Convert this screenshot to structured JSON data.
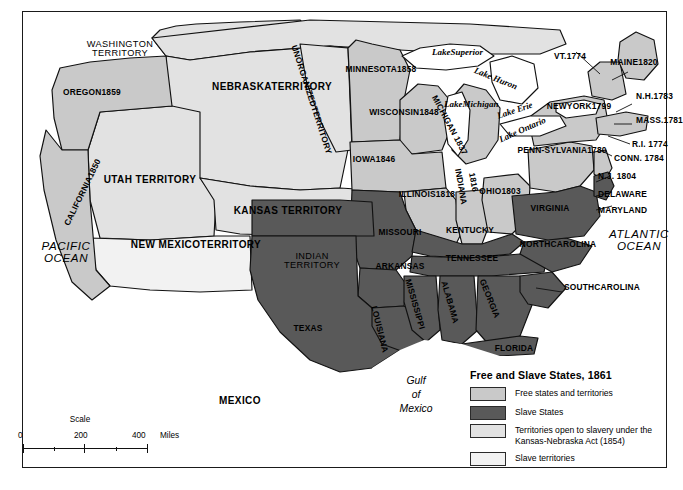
{
  "map": {
    "title": "Free and Slave States, 1861",
    "colors": {
      "free": "#c9c9c9",
      "slave": "#595959",
      "kansas_nebraska": "#e2e2e2",
      "slave_territory": "#f2f2f2",
      "water": "#ffffff",
      "outline": "#111111"
    },
    "oceans": [
      {
        "name": "pacific-ocean",
        "lines": [
          "PACIFIC",
          "OCEAN"
        ]
      },
      {
        "name": "atlantic-ocean",
        "lines": [
          "ATLANTIC",
          "OCEAN"
        ]
      }
    ],
    "gulf": {
      "lines": [
        "Gulf",
        "of",
        "Mexico"
      ]
    },
    "mexico": "MEXICO",
    "lakes": [
      {
        "label": "Lake",
        "label2": "Superior"
      },
      {
        "label": "Lake Huron"
      },
      {
        "label": "Lake",
        "label2": "Michigan"
      },
      {
        "label": "Lake Erie"
      },
      {
        "label": "Lake Ontario"
      }
    ],
    "regions": [
      {
        "name": "washington-territory",
        "lines": [
          "WASHINGTON",
          "TERRITORY"
        ],
        "fill": "kansas_nebraska"
      },
      {
        "name": "oregon",
        "lines": [
          "OREGON",
          "1859"
        ],
        "fill": "free"
      },
      {
        "name": "california",
        "lines": [
          "CALIFORNIA",
          "1850"
        ],
        "fill": "free"
      },
      {
        "name": "utah-territory",
        "lines": [
          "UTAH TERRITORY"
        ],
        "fill": "kansas_nebraska"
      },
      {
        "name": "new-mexico-territory",
        "lines": [
          "NEW MEXICO",
          "TERRITORY"
        ],
        "fill": "slave_territory"
      },
      {
        "name": "nebraska-territory",
        "lines": [
          "NEBRASKA",
          "TERRITORY"
        ],
        "fill": "kansas_nebraska"
      },
      {
        "name": "unorganized-territory",
        "lines": [
          "UNORGANIZED",
          "TERRITORY"
        ],
        "fill": "kansas_nebraska"
      },
      {
        "name": "kansas-territory",
        "lines": [
          "KANSAS TERRITORY"
        ],
        "fill": "kansas_nebraska"
      },
      {
        "name": "indian-territory",
        "lines": [
          "INDIAN",
          "TERRITORY"
        ],
        "fill": "slave"
      },
      {
        "name": "minnesota",
        "lines": [
          "MINNESOTA",
          "1858"
        ],
        "fill": "free"
      },
      {
        "name": "wisconsin",
        "lines": [
          "WISCONSIN",
          "1848"
        ],
        "fill": "free"
      },
      {
        "name": "iowa",
        "lines": [
          "IOWA",
          "1846"
        ],
        "fill": "free"
      },
      {
        "name": "illinois",
        "lines": [
          "ILLINOIS",
          "1818"
        ],
        "fill": "free"
      },
      {
        "name": "indiana",
        "lines": [
          "INDIANA",
          "1816"
        ],
        "fill": "free"
      },
      {
        "name": "michigan",
        "lines": [
          "MICHIGAN 1837"
        ],
        "fill": "free"
      },
      {
        "name": "ohio",
        "lines": [
          "OHIO",
          "1803"
        ],
        "fill": "free"
      },
      {
        "name": "pennsylvania",
        "lines": [
          "PENN-",
          "SYLVANIA",
          "1780"
        ],
        "fill": "free"
      },
      {
        "name": "new-york",
        "lines": [
          "NEW",
          "YORK",
          "1799"
        ],
        "fill": "free"
      },
      {
        "name": "vermont",
        "lines": [
          "VT.",
          "1774"
        ],
        "fill": "free"
      },
      {
        "name": "maine",
        "lines": [
          "MAINE",
          "1820"
        ],
        "fill": "free"
      },
      {
        "name": "new-hampshire",
        "lines": [
          "N.H.",
          "1783"
        ],
        "fill": "free"
      },
      {
        "name": "massachusetts",
        "lines": [
          "MASS.",
          "1781"
        ],
        "fill": "free"
      },
      {
        "name": "rhode-island",
        "lines": [
          "R.I. 1774"
        ],
        "fill": "free"
      },
      {
        "name": "connecticut",
        "lines": [
          "CONN. 1784"
        ],
        "fill": "free"
      },
      {
        "name": "new-jersey",
        "lines": [
          "N.J. 1804"
        ],
        "fill": "free"
      },
      {
        "name": "delaware",
        "lines": [
          "DELAWARE"
        ],
        "fill": "slave"
      },
      {
        "name": "maryland",
        "lines": [
          "MARYLAND"
        ],
        "fill": "slave"
      },
      {
        "name": "virginia",
        "lines": [
          "VIRGINIA"
        ],
        "fill": "slave"
      },
      {
        "name": "missouri",
        "lines": [
          "MISSOURI"
        ],
        "fill": "slave"
      },
      {
        "name": "kentucky",
        "lines": [
          "KENTUCKY"
        ],
        "fill": "slave"
      },
      {
        "name": "tennessee",
        "lines": [
          "TENNESSEE"
        ],
        "fill": "slave"
      },
      {
        "name": "arkansas",
        "lines": [
          "ARKANSAS"
        ],
        "fill": "slave"
      },
      {
        "name": "north-carolina",
        "lines": [
          "NORTH",
          "CAROLINA"
        ],
        "fill": "slave"
      },
      {
        "name": "south-carolina",
        "lines": [
          "SOUTH",
          "CAROLINA"
        ],
        "fill": "slave"
      },
      {
        "name": "georgia",
        "lines": [
          "GEORGIA"
        ],
        "fill": "slave"
      },
      {
        "name": "alabama",
        "lines": [
          "ALABAMA"
        ],
        "fill": "slave"
      },
      {
        "name": "mississippi",
        "lines": [
          "MISSISSIPPI"
        ],
        "fill": "slave"
      },
      {
        "name": "louisiana",
        "lines": [
          "LOUISIANA"
        ],
        "fill": "slave"
      },
      {
        "name": "florida",
        "lines": [
          "FLORIDA"
        ],
        "fill": "slave"
      },
      {
        "name": "texas",
        "lines": [
          "TEXAS"
        ],
        "fill": "slave"
      }
    ],
    "labels": {
      "washington_territory_1": "WASHINGTON",
      "washington_territory_2": "TERRITORY",
      "oregon_1": "OREGON",
      "oregon_2": "1859",
      "california_1": "CALIFORNIA",
      "california_2": "1850",
      "utah_territory": "UTAH TERRITORY",
      "new_mexico_1": "NEW MEXICO",
      "new_mexico_2": "TERRITORY",
      "nebraska_1": "NEBRASKA",
      "nebraska_2": "TERRITORY",
      "unorganized_1": "UNORGANIZED",
      "unorganized_2": "TERRITORY",
      "kansas_territory": "KANSAS TERRITORY",
      "indian_1": "INDIAN",
      "indian_2": "TERRITORY",
      "minnesota_1": "MINNESOTA",
      "minnesota_2": "1858",
      "wisconsin_1": "WISCONSIN",
      "wisconsin_2": "1848",
      "iowa_1": "IOWA",
      "iowa_2": "1846",
      "illinois_1": "ILLINOIS",
      "illinois_2": "1818",
      "indiana": "INDIANA",
      "indiana_year": "1816",
      "michigan": "MICHIGAN 1837",
      "ohio_1": "OHIO",
      "ohio_2": "1803",
      "penn_1": "PENN-",
      "penn_2": "SYLVANIA",
      "penn_3": "1780",
      "ny_1": "NEW",
      "ny_2": "YORK",
      "ny_3": "1799",
      "vt_1": "VT.",
      "vt_2": "1774",
      "maine_1": "MAINE",
      "maine_2": "1820",
      "nh_1": "N.H.",
      "nh_2": "1783",
      "mass_1": "MASS.",
      "mass_2": "1781",
      "ri": "R.I. 1774",
      "conn": "CONN. 1784",
      "nj": "N.J. 1804",
      "delaware": "DELAWARE",
      "maryland": "MARYLAND",
      "virginia": "VIRGINIA",
      "missouri": "MISSOURI",
      "kentucky": "KENTUCKY",
      "tennessee": "TENNESSEE",
      "arkansas": "ARKANSAS",
      "nc_1": "NORTH",
      "nc_2": "CAROLINA",
      "sc_1": "SOUTH",
      "sc_2": "CAROLINA",
      "georgia": "GEORGIA",
      "alabama": "ALABAMA",
      "mississippi": "MISSISSIPPI",
      "louisiana": "LOUISIANA",
      "florida": "FLORIDA",
      "texas": "TEXAS",
      "mexico": "MEXICO",
      "lake_superior_1": "Lake",
      "lake_superior_2": "Superior",
      "lake_huron": "Lake Huron",
      "lake_michigan_1": "Lake",
      "lake_michigan_2": "Michigan",
      "lake_erie": "Lake Erie",
      "lake_ontario": "Lake Ontario",
      "pacific_1": "PACIFIC",
      "pacific_2": "OCEAN",
      "atlantic_1": "ATLANTIC",
      "atlantic_2": "OCEAN",
      "gulf_1": "Gulf",
      "gulf_2": "of",
      "gulf_3": "Mexico"
    }
  },
  "legend": {
    "title": "Free and Slave States, 1861",
    "items": [
      {
        "name": "free-states",
        "label": "Free states and territories",
        "color": "#c9c9c9"
      },
      {
        "name": "slave-states",
        "label": "Slave States",
        "color": "#595959"
      },
      {
        "name": "kansas-nebraska",
        "label": "Territories open to slavery under the Kansas-Nebraska Act (1854)",
        "color": "#e2e2e2"
      },
      {
        "name": "slave-territories",
        "label": "Slave territories",
        "color": "#f2f2f2"
      }
    ]
  },
  "scale": {
    "title": "Scale",
    "zero": "0",
    "mid": "200",
    "max": "400",
    "unit": "Miles"
  }
}
